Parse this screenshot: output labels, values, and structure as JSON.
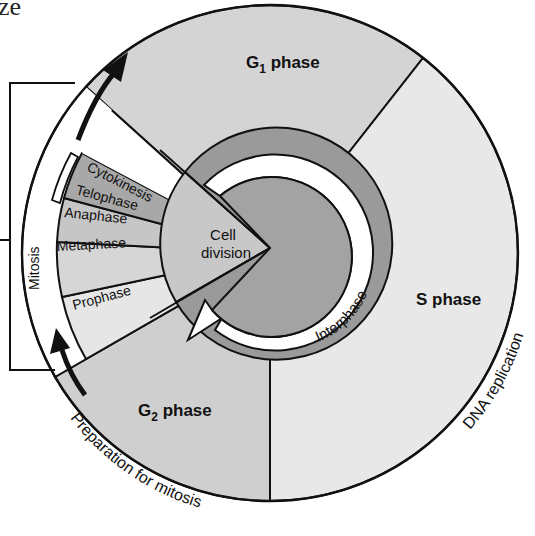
{
  "corner_fragment": "ze",
  "phases": {
    "g1": {
      "label_main": "G",
      "label_sub": "1",
      "label_rest": " phase"
    },
    "s": {
      "label": "S phase",
      "annotation": "DNA replication"
    },
    "g2": {
      "label_main": "G",
      "label_sub": "2",
      "label_rest": " phase",
      "annotation": "Preparation for mitosis"
    }
  },
  "center": {
    "interphase_label": "Interphase",
    "cell_division_line1": "Cell",
    "cell_division_line2": "division"
  },
  "mitosis": {
    "bracket_label": "Mitosis",
    "stages": [
      {
        "label": "Cytokinesis"
      },
      {
        "label": "Telophase"
      },
      {
        "label": "Anaphase"
      },
      {
        "label": "Metaphase"
      },
      {
        "label": "Prophase"
      }
    ]
  },
  "colors": {
    "g1_fill": "#d4d4d4",
    "s_fill": "#e8e8e8",
    "g2_fill": "#cfcfcf",
    "ring_dark": "#9a9a9a",
    "core_dark": "#a3a3a3",
    "white": "#ffffff",
    "cell_division_fill": "#c8c8c8",
    "cytokinesis_fill": "#ffffff",
    "telophase_fill": "#a8a8a8",
    "anaphase_fill": "#c6c6c6",
    "metaphase_fill": "#d6d6d6",
    "prophase_fill": "#e6e6e6",
    "stroke": "#111111"
  }
}
